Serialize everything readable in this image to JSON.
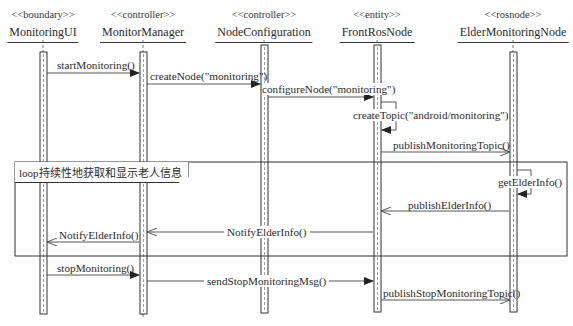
{
  "diagram": {
    "type": "sequence",
    "participants": [
      {
        "stereotype": "<<boundary>>",
        "name": "MonitoringUI",
        "x": 43
      },
      {
        "stereotype": "<<controller>>",
        "name": "MonitorManager",
        "x": 143
      },
      {
        "stereotype": "<<controller>>",
        "name": "NodeConfiguration",
        "x": 264
      },
      {
        "stereotype": "<<entity>>",
        "name": "FrontRosNode",
        "x": 377
      },
      {
        "stereotype": "<<rosnode>>",
        "name": "ElderMonitoringNode",
        "x": 513
      }
    ],
    "messages": [
      {
        "label": "startMonitoring()",
        "from": "MonitoringUI",
        "to": "MonitorManager",
        "kind": "sync"
      },
      {
        "label": "createNode(\"monitoring\")",
        "from": "MonitorManager",
        "to": "NodeConfiguration",
        "kind": "sync"
      },
      {
        "label": "configureNode(\"monitoring\")",
        "from": "NodeConfiguration",
        "to": "FrontRosNode",
        "kind": "sync"
      },
      {
        "label": "createTopic(\"android/monitoring\")",
        "from": "FrontRosNode",
        "to": "FrontRosNode",
        "kind": "self"
      },
      {
        "label": "publishMonitoringTopic()",
        "from": "FrontRosNode",
        "to": "ElderMonitoringNode",
        "kind": "async"
      },
      {
        "label": "getElderInfo()",
        "from": "ElderMonitoringNode",
        "to": "ElderMonitoringNode",
        "kind": "self"
      },
      {
        "label": "publishElderInfo()",
        "from": "ElderMonitoringNode",
        "to": "FrontRosNode",
        "kind": "async"
      },
      {
        "label": "NotifyElderInfo()",
        "from": "FrontRosNode",
        "to": "MonitorManager",
        "kind": "async"
      },
      {
        "label": "NotifyElderInfo()",
        "from": "MonitorManager",
        "to": "MonitoringUI",
        "kind": "async"
      },
      {
        "label": "stopMonitoring()",
        "from": "MonitoringUI",
        "to": "MonitorManager",
        "kind": "sync"
      },
      {
        "label": "sendStopMonitoringMsg()",
        "from": "MonitorManager",
        "to": "FrontRosNode",
        "kind": "sync"
      },
      {
        "label": "publishStopMonitoringTopic()",
        "from": "FrontRosNode",
        "to": "ElderMonitoringNode",
        "kind": "async"
      }
    ],
    "fragments": [
      {
        "operator": "loop",
        "label": "loop持续性地获取和显示老人信息"
      }
    ]
  }
}
